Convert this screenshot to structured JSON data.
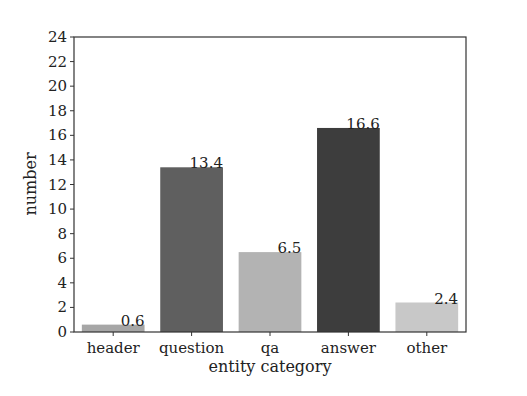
{
  "chart_data": {
    "type": "bar",
    "title": "",
    "xlabel": "entity category",
    "ylabel": "number",
    "categories": [
      "header",
      "question",
      "qa",
      "answer",
      "other"
    ],
    "values": [
      0.6,
      13.4,
      6.5,
      16.6,
      2.4
    ],
    "data_labels": [
      "0.6",
      "13.4",
      "6.5",
      "16.6",
      "2.4"
    ],
    "bar_colors": [
      "#a6a6a6",
      "#5f5f5f",
      "#b3b3b3",
      "#3d3d3d",
      "#c8c8c8"
    ],
    "ylim": [
      0,
      24
    ],
    "yticks": [
      0,
      2,
      4,
      6,
      8,
      10,
      12,
      14,
      16,
      18,
      20,
      22,
      24
    ],
    "grid": false,
    "legend": null
  }
}
